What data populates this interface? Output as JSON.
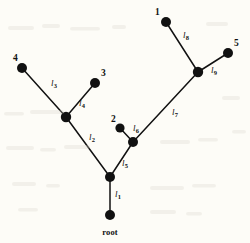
{
  "figure": {
    "type": "phylogenetic-tree",
    "background_color": "#fdfcf7",
    "ink_color": "#111111"
  },
  "nodes": [
    {
      "id": "tip-1",
      "label": "1",
      "kind": "tip",
      "x": 166,
      "y": 22,
      "r": 5.0,
      "label_x": 155,
      "label_y": 8,
      "label_anchor": "above-left"
    },
    {
      "id": "tip-2",
      "label": "2",
      "kind": "tip",
      "x": 120,
      "y": 128,
      "r": 4.6,
      "label_x": 111,
      "label_y": 115,
      "label_anchor": "above-left"
    },
    {
      "id": "tip-3",
      "label": "3",
      "kind": "tip",
      "x": 95,
      "y": 83,
      "r": 5.0,
      "label_x": 101,
      "label_y": 69,
      "label_anchor": "above-right"
    },
    {
      "id": "tip-4",
      "label": "4",
      "kind": "tip",
      "x": 22,
      "y": 68,
      "r": 5.0,
      "label_x": 13,
      "label_y": 54,
      "label_anchor": "above-left"
    },
    {
      "id": "tip-5",
      "label": "5",
      "kind": "tip",
      "x": 228,
      "y": 53,
      "r": 5.0,
      "label_x": 234,
      "label_y": 39,
      "label_anchor": "above-right"
    },
    {
      "id": "node-a",
      "label": "",
      "kind": "internal",
      "x": 110,
      "y": 177,
      "r": 5.0,
      "label_x": 0,
      "label_y": 0,
      "label_anchor": "none"
    },
    {
      "id": "node-b",
      "label": "",
      "kind": "internal",
      "x": 66,
      "y": 117,
      "r": 5.2,
      "label_x": 0,
      "label_y": 0,
      "label_anchor": "none"
    },
    {
      "id": "node-c",
      "label": "",
      "kind": "internal",
      "x": 133,
      "y": 142,
      "r": 5.0,
      "label_x": 0,
      "label_y": 0,
      "label_anchor": "none"
    },
    {
      "id": "node-d",
      "label": "",
      "kind": "internal",
      "x": 198,
      "y": 72,
      "r": 5.2,
      "label_x": 0,
      "label_y": 0,
      "label_anchor": "none"
    },
    {
      "id": "node-root",
      "label": "root",
      "kind": "root",
      "x": 110,
      "y": 215,
      "r": 5.0,
      "label_x": 110,
      "label_y": 228,
      "label_anchor": "below-center"
    }
  ],
  "branches": [
    {
      "id": "l1",
      "label": "l",
      "subscript": "1",
      "from": "node-root",
      "to": "node-a",
      "x1": 110,
      "y1": 215,
      "x2": 110,
      "y2": 177,
      "label_x": 115,
      "label_y": 190
    },
    {
      "id": "l2",
      "label": "l",
      "subscript": "2",
      "from": "node-a",
      "to": "node-b",
      "x1": 110,
      "y1": 177,
      "x2": 66,
      "y2": 117,
      "label_x": 89,
      "label_y": 133
    },
    {
      "id": "l3",
      "label": "l",
      "subscript": "3",
      "from": "node-b",
      "to": "tip-4",
      "x1": 66,
      "y1": 117,
      "x2": 22,
      "y2": 68,
      "label_x": 51,
      "label_y": 79
    },
    {
      "id": "l4",
      "label": "l",
      "subscript": "4",
      "from": "node-b",
      "to": "tip-3",
      "x1": 66,
      "y1": 117,
      "x2": 95,
      "y2": 83,
      "label_x": 79,
      "label_y": 99
    },
    {
      "id": "l5",
      "label": "l",
      "subscript": "5",
      "from": "node-a",
      "to": "node-c",
      "x1": 110,
      "y1": 177,
      "x2": 133,
      "y2": 142,
      "label_x": 122,
      "label_y": 159
    },
    {
      "id": "l6",
      "label": "l",
      "subscript": "6",
      "from": "node-c",
      "to": "tip-2",
      "x1": 133,
      "y1": 142,
      "x2": 120,
      "y2": 128,
      "label_x": 133,
      "label_y": 124
    },
    {
      "id": "l7",
      "label": "l",
      "subscript": "7",
      "from": "node-c",
      "to": "node-d",
      "x1": 133,
      "y1": 142,
      "x2": 198,
      "y2": 72,
      "label_x": 172,
      "label_y": 108
    },
    {
      "id": "l8",
      "label": "l",
      "subscript": "8",
      "from": "node-d",
      "to": "tip-1",
      "x1": 198,
      "y1": 72,
      "x2": 166,
      "y2": 22,
      "label_x": 183,
      "label_y": 31
    },
    {
      "id": "l9",
      "label": "l",
      "subscript": "9",
      "from": "node-d",
      "to": "tip-5",
      "x1": 198,
      "y1": 72,
      "x2": 228,
      "y2": 53,
      "label_x": 211,
      "label_y": 66
    }
  ]
}
